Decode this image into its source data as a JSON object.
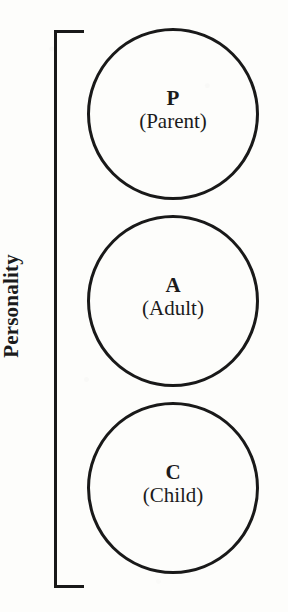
{
  "figure": {
    "background_color": "#fdfdfb",
    "ink_color": "#191919"
  },
  "bracket": {
    "name": "personality-bracket",
    "label": "Personality",
    "orientation": "vertical-left",
    "spans_items": [
      "P",
      "A",
      "C"
    ]
  },
  "ego_states": [
    {
      "key": "parent",
      "letter": "P",
      "name": "(Parent)"
    },
    {
      "key": "adult",
      "letter": "A",
      "name": "(Adult)"
    },
    {
      "key": "child",
      "letter": "C",
      "name": "(Child)"
    }
  ]
}
